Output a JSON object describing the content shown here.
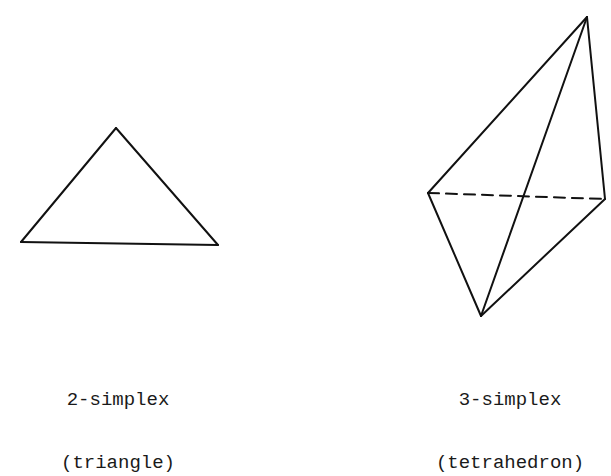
{
  "figures": [
    {
      "id": "triangle",
      "caption_line1": "2-simplex",
      "caption_line2": "(triangle)",
      "vertices": [
        [
          116,
          128
        ],
        [
          21,
          242
        ],
        [
          218,
          245
        ]
      ],
      "edges": [
        {
          "from": 0,
          "to": 1,
          "style": "solid"
        },
        {
          "from": 1,
          "to": 2,
          "style": "solid"
        },
        {
          "from": 2,
          "to": 0,
          "style": "solid"
        }
      ]
    },
    {
      "id": "tetrahedron",
      "caption_line1": "3-simplex",
      "caption_line2": "(tetrahedron)",
      "vertices": [
        [
          587,
          17
        ],
        [
          428,
          193
        ],
        [
          605,
          199
        ],
        [
          481,
          316
        ]
      ],
      "edges": [
        {
          "from": 0,
          "to": 1,
          "style": "solid"
        },
        {
          "from": 0,
          "to": 2,
          "style": "solid"
        },
        {
          "from": 0,
          "to": 3,
          "style": "solid"
        },
        {
          "from": 1,
          "to": 3,
          "style": "solid"
        },
        {
          "from": 2,
          "to": 3,
          "style": "solid"
        },
        {
          "from": 1,
          "to": 2,
          "style": "dashed"
        }
      ]
    }
  ],
  "colors": {
    "stroke": "#111111",
    "text": "#1a1a1a",
    "background": "#ffffff"
  }
}
